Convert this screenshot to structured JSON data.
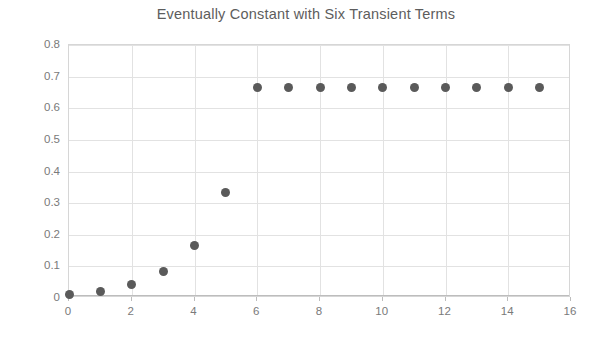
{
  "chart_data": {
    "type": "scatter",
    "title": "Eventually Constant with Six Transient Terms",
    "xlabel": "",
    "ylabel": "",
    "x": [
      0,
      1,
      2,
      3,
      4,
      5,
      6,
      7,
      8,
      9,
      10,
      11,
      12,
      13,
      14,
      15
    ],
    "values": [
      0.0104,
      0.0208,
      0.0417,
      0.0833,
      0.1667,
      0.3333,
      0.6667,
      0.6667,
      0.6667,
      0.6667,
      0.6667,
      0.6667,
      0.6667,
      0.6667,
      0.6667,
      0.6667
    ],
    "series": [
      {
        "name": "sequence",
        "values": [
          0.0104,
          0.0208,
          0.0417,
          0.0833,
          0.1667,
          0.3333,
          0.6667,
          0.6667,
          0.6667,
          0.6667,
          0.6667,
          0.6667,
          0.6667,
          0.6667,
          0.6667,
          0.6667
        ]
      }
    ],
    "xlim": [
      0,
      16
    ],
    "ylim": [
      0,
      0.8
    ],
    "xticks": [
      0,
      2,
      4,
      6,
      8,
      10,
      12,
      14,
      16
    ],
    "xtick_labels": [
      "0",
      "2",
      "4",
      "6",
      "8",
      "10",
      "12",
      "14",
      "16"
    ],
    "yticks": [
      0,
      0.1,
      0.2,
      0.3,
      0.4,
      0.5,
      0.6,
      0.7,
      0.8
    ],
    "ytick_labels": [
      "0",
      "0.1",
      "0.2",
      "0.3",
      "0.4",
      "0.5",
      "0.6",
      "0.7",
      "0.8"
    ],
    "grid": true,
    "legend": false,
    "marker_color": "#5a5a5a",
    "grid_color": "#e2e2e2",
    "text_color": "#7a7a7a",
    "title_color": "#5d5d5d",
    "background": "#ffffff"
  }
}
